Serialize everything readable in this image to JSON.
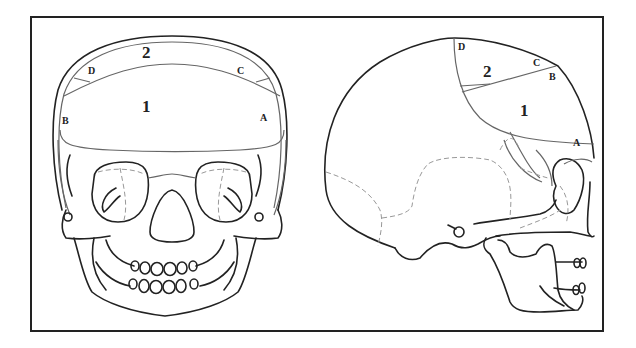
{
  "figure": {
    "frontal_view": {
      "regions": [
        {
          "id": "region-2",
          "label": "2"
        },
        {
          "id": "region-1",
          "label": "1"
        }
      ],
      "points": [
        {
          "id": "point-D",
          "label": "D"
        },
        {
          "id": "point-C",
          "label": "C"
        },
        {
          "id": "point-B",
          "label": "B"
        },
        {
          "id": "point-A",
          "label": "A"
        }
      ]
    },
    "lateral_view": {
      "regions": [
        {
          "id": "region-2",
          "label": "2"
        },
        {
          "id": "region-1",
          "label": "1"
        }
      ],
      "points": [
        {
          "id": "point-D",
          "label": "D"
        },
        {
          "id": "point-C",
          "label": "C"
        },
        {
          "id": "point-B",
          "label": "B"
        },
        {
          "id": "point-A",
          "label": "A"
        }
      ]
    }
  },
  "colors": {
    "outline": "#222222",
    "region_boundary": "#666666",
    "suture_dashed": "#999999",
    "background": "#ffffff"
  }
}
